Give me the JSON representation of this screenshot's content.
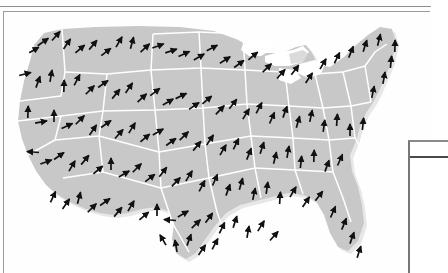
{
  "page": {
    "background_color": "#fefefe",
    "rule_color": "#8e8e8e",
    "frame_color": "#9b9b9b"
  },
  "figure": {
    "name": "us-vector-field-map",
    "caption": "",
    "map": {
      "region": "United States (contiguous)",
      "land_fill": "#c8c8c8",
      "state_border_color": "#ffffff",
      "ocean_fill": "#ffffff",
      "shadow_color": "#d9d9d9",
      "arrow_color": "#111111",
      "arrow_count": 268,
      "arrow_style": "line-with-solid-head"
    }
  },
  "side_panel": {
    "name": "legend-table",
    "visible_portion": "left edge only",
    "border_color": "#767676",
    "header_rule_color": "#4a4a4a",
    "header_label": "",
    "cell_label": ""
  },
  "chart_data": {
    "type": "scatter",
    "title": "",
    "subtitle": "",
    "xlabel": "",
    "ylabel": "",
    "grid": false,
    "legend_position": "right",
    "xlim": [
      0,
      400
    ],
    "ylim": [
      0,
      250
    ],
    "arrows": [
      {
        "x": 40,
        "y": 30,
        "angle": -35,
        "len": 13
      },
      {
        "x": 53,
        "y": 24,
        "angle": -48,
        "len": 12
      },
      {
        "x": 31,
        "y": 38,
        "angle": -30,
        "len": 11
      },
      {
        "x": 64,
        "y": 32,
        "angle": -55,
        "len": 12
      },
      {
        "x": 77,
        "y": 37,
        "angle": -40,
        "len": 12
      },
      {
        "x": 90,
        "y": 33,
        "angle": -50,
        "len": 12
      },
      {
        "x": 103,
        "y": 40,
        "angle": -38,
        "len": 12
      },
      {
        "x": 116,
        "y": 30,
        "angle": -60,
        "len": 12
      },
      {
        "x": 129,
        "y": 31,
        "angle": -75,
        "len": 12
      },
      {
        "x": 142,
        "y": 36,
        "angle": -42,
        "len": 12
      },
      {
        "x": 155,
        "y": 34,
        "angle": -20,
        "len": 12
      },
      {
        "x": 168,
        "y": 39,
        "angle": -18,
        "len": 12
      },
      {
        "x": 181,
        "y": 42,
        "angle": -25,
        "len": 12
      },
      {
        "x": 196,
        "y": 45,
        "angle": -30,
        "len": 12
      },
      {
        "x": 209,
        "y": 36,
        "angle": -28,
        "len": 12
      },
      {
        "x": 222,
        "y": 48,
        "angle": -32,
        "len": 12
      },
      {
        "x": 236,
        "y": 52,
        "angle": -36,
        "len": 12
      },
      {
        "x": 250,
        "y": 44,
        "angle": -40,
        "len": 12
      },
      {
        "x": 264,
        "y": 56,
        "angle": -44,
        "len": 12
      },
      {
        "x": 278,
        "y": 62,
        "angle": -48,
        "len": 12
      },
      {
        "x": 292,
        "y": 58,
        "angle": -52,
        "len": 12
      },
      {
        "x": 306,
        "y": 66,
        "angle": -56,
        "len": 12
      },
      {
        "x": 320,
        "y": 52,
        "angle": -60,
        "len": 12
      },
      {
        "x": 334,
        "y": 46,
        "angle": -64,
        "len": 12
      },
      {
        "x": 348,
        "y": 40,
        "angle": -68,
        "len": 12
      },
      {
        "x": 362,
        "y": 34,
        "angle": -72,
        "len": 12
      },
      {
        "x": 376,
        "y": 28,
        "angle": -76,
        "len": 12
      },
      {
        "x": 22,
        "y": 62,
        "angle": -15,
        "len": 12
      },
      {
        "x": 35,
        "y": 70,
        "angle": -70,
        "len": 12
      },
      {
        "x": 48,
        "y": 64,
        "angle": -80,
        "len": 12
      },
      {
        "x": 61,
        "y": 74,
        "angle": -88,
        "len": 12
      },
      {
        "x": 74,
        "y": 68,
        "angle": -62,
        "len": 12
      },
      {
        "x": 87,
        "y": 78,
        "angle": -45,
        "len": 12
      },
      {
        "x": 100,
        "y": 72,
        "angle": -35,
        "len": 12
      },
      {
        "x": 113,
        "y": 82,
        "angle": -50,
        "len": 12
      },
      {
        "x": 126,
        "y": 76,
        "angle": -55,
        "len": 12
      },
      {
        "x": 139,
        "y": 86,
        "angle": -42,
        "len": 12
      },
      {
        "x": 152,
        "y": 80,
        "angle": -38,
        "len": 12
      },
      {
        "x": 165,
        "y": 90,
        "angle": -30,
        "len": 12
      },
      {
        "x": 178,
        "y": 84,
        "angle": -26,
        "len": 12
      },
      {
        "x": 191,
        "y": 94,
        "angle": -34,
        "len": 12
      },
      {
        "x": 204,
        "y": 88,
        "angle": -40,
        "len": 12
      },
      {
        "x": 217,
        "y": 98,
        "angle": -46,
        "len": 12
      },
      {
        "x": 230,
        "y": 92,
        "angle": -52,
        "len": 12
      },
      {
        "x": 243,
        "y": 102,
        "angle": -58,
        "len": 12
      },
      {
        "x": 256,
        "y": 96,
        "angle": -62,
        "len": 12
      },
      {
        "x": 269,
        "y": 106,
        "angle": -66,
        "len": 12
      },
      {
        "x": 282,
        "y": 100,
        "angle": -70,
        "len": 12
      },
      {
        "x": 295,
        "y": 110,
        "angle": -74,
        "len": 12
      },
      {
        "x": 308,
        "y": 104,
        "angle": -78,
        "len": 12
      },
      {
        "x": 321,
        "y": 114,
        "angle": -82,
        "len": 12
      },
      {
        "x": 334,
        "y": 108,
        "angle": -86,
        "len": 12
      },
      {
        "x": 347,
        "y": 118,
        "angle": -90,
        "len": 12
      },
      {
        "x": 360,
        "y": 112,
        "angle": -84,
        "len": 12
      },
      {
        "x": 25,
        "y": 100,
        "angle": -88,
        "len": 12
      },
      {
        "x": 38,
        "y": 110,
        "angle": -10,
        "len": 12
      },
      {
        "x": 51,
        "y": 104,
        "angle": -90,
        "len": 12
      },
      {
        "x": 64,
        "y": 114,
        "angle": -25,
        "len": 12
      },
      {
        "x": 77,
        "y": 108,
        "angle": -45,
        "len": 12
      },
      {
        "x": 90,
        "y": 118,
        "angle": -55,
        "len": 12
      },
      {
        "x": 103,
        "y": 112,
        "angle": -35,
        "len": 12
      },
      {
        "x": 116,
        "y": 122,
        "angle": -48,
        "len": 12
      },
      {
        "x": 129,
        "y": 116,
        "angle": -58,
        "len": 12
      },
      {
        "x": 142,
        "y": 126,
        "angle": -40,
        "len": 12
      },
      {
        "x": 155,
        "y": 120,
        "angle": -30,
        "len": 12
      },
      {
        "x": 168,
        "y": 130,
        "angle": -36,
        "len": 12
      },
      {
        "x": 181,
        "y": 124,
        "angle": -44,
        "len": 12
      },
      {
        "x": 194,
        "y": 134,
        "angle": -50,
        "len": 12
      },
      {
        "x": 207,
        "y": 128,
        "angle": -56,
        "len": 12
      },
      {
        "x": 220,
        "y": 138,
        "angle": -60,
        "len": 12
      },
      {
        "x": 233,
        "y": 132,
        "angle": -64,
        "len": 12
      },
      {
        "x": 246,
        "y": 142,
        "angle": -68,
        "len": 12
      },
      {
        "x": 259,
        "y": 136,
        "angle": -72,
        "len": 12
      },
      {
        "x": 272,
        "y": 146,
        "angle": -76,
        "len": 12
      },
      {
        "x": 285,
        "y": 140,
        "angle": -80,
        "len": 12
      },
      {
        "x": 298,
        "y": 150,
        "angle": -84,
        "len": 12
      },
      {
        "x": 311,
        "y": 144,
        "angle": -88,
        "len": 12
      },
      {
        "x": 324,
        "y": 154,
        "angle": -70,
        "len": 12
      },
      {
        "x": 337,
        "y": 148,
        "angle": -66,
        "len": 12
      },
      {
        "x": 30,
        "y": 140,
        "angle": -175,
        "len": 12
      },
      {
        "x": 43,
        "y": 150,
        "angle": -20,
        "len": 12
      },
      {
        "x": 56,
        "y": 144,
        "angle": -35,
        "len": 12
      },
      {
        "x": 69,
        "y": 154,
        "angle": -60,
        "len": 12
      },
      {
        "x": 82,
        "y": 148,
        "angle": -50,
        "len": 12
      },
      {
        "x": 95,
        "y": 158,
        "angle": -40,
        "len": 12
      },
      {
        "x": 108,
        "y": 152,
        "angle": -90,
        "len": 12
      },
      {
        "x": 121,
        "y": 162,
        "angle": -30,
        "len": 12
      },
      {
        "x": 134,
        "y": 156,
        "angle": -45,
        "len": 12
      },
      {
        "x": 147,
        "y": 166,
        "angle": -38,
        "len": 12
      },
      {
        "x": 160,
        "y": 160,
        "angle": -52,
        "len": 12
      },
      {
        "x": 173,
        "y": 170,
        "angle": -46,
        "len": 12
      },
      {
        "x": 186,
        "y": 164,
        "angle": -58,
        "len": 12
      },
      {
        "x": 199,
        "y": 174,
        "angle": -62,
        "len": 12
      },
      {
        "x": 212,
        "y": 168,
        "angle": -66,
        "len": 12
      },
      {
        "x": 225,
        "y": 178,
        "angle": -70,
        "len": 12
      },
      {
        "x": 238,
        "y": 172,
        "angle": -74,
        "len": 12
      },
      {
        "x": 251,
        "y": 182,
        "angle": -78,
        "len": 12
      },
      {
        "x": 264,
        "y": 176,
        "angle": -82,
        "len": 12
      },
      {
        "x": 277,
        "y": 186,
        "angle": -86,
        "len": 12
      },
      {
        "x": 290,
        "y": 180,
        "angle": -60,
        "len": 12
      },
      {
        "x": 303,
        "y": 190,
        "angle": -56,
        "len": 12
      },
      {
        "x": 316,
        "y": 184,
        "angle": -52,
        "len": 12
      },
      {
        "x": 50,
        "y": 185,
        "angle": -65,
        "len": 12
      },
      {
        "x": 63,
        "y": 192,
        "angle": -55,
        "len": 12
      },
      {
        "x": 76,
        "y": 186,
        "angle": -75,
        "len": 12
      },
      {
        "x": 89,
        "y": 196,
        "angle": -45,
        "len": 12
      },
      {
        "x": 102,
        "y": 190,
        "angle": -35,
        "len": 12
      },
      {
        "x": 115,
        "y": 200,
        "angle": -50,
        "len": 12
      },
      {
        "x": 128,
        "y": 194,
        "angle": -60,
        "len": 12
      },
      {
        "x": 141,
        "y": 204,
        "angle": -40,
        "len": 12
      },
      {
        "x": 154,
        "y": 198,
        "angle": -90,
        "len": 12
      },
      {
        "x": 167,
        "y": 208,
        "angle": -175,
        "len": 12
      },
      {
        "x": 180,
        "y": 202,
        "angle": -30,
        "len": 12
      },
      {
        "x": 193,
        "y": 212,
        "angle": -44,
        "len": 12
      },
      {
        "x": 206,
        "y": 206,
        "angle": -54,
        "len": 12
      },
      {
        "x": 219,
        "y": 216,
        "angle": -64,
        "len": 12
      },
      {
        "x": 232,
        "y": 210,
        "angle": -72,
        "len": 12
      },
      {
        "x": 245,
        "y": 220,
        "angle": -80,
        "len": 12
      },
      {
        "x": 258,
        "y": 214,
        "angle": -58,
        "len": 12
      },
      {
        "x": 271,
        "y": 224,
        "angle": -48,
        "len": 12
      },
      {
        "x": 160,
        "y": 228,
        "angle": -120,
        "len": 12
      },
      {
        "x": 173,
        "y": 234,
        "angle": -100,
        "len": 12
      },
      {
        "x": 186,
        "y": 228,
        "angle": -70,
        "len": 12
      },
      {
        "x": 199,
        "y": 238,
        "angle": -55,
        "len": 12
      },
      {
        "x": 212,
        "y": 232,
        "angle": -62,
        "len": 12
      },
      {
        "x": 330,
        "y": 200,
        "angle": -66,
        "len": 12
      },
      {
        "x": 341,
        "y": 212,
        "angle": -68,
        "len": 12
      },
      {
        "x": 349,
        "y": 226,
        "angle": -70,
        "len": 12
      },
      {
        "x": 356,
        "y": 240,
        "angle": -72,
        "len": 12
      },
      {
        "x": 370,
        "y": 80,
        "angle": -78,
        "len": 12
      },
      {
        "x": 381,
        "y": 66,
        "angle": -80,
        "len": 12
      },
      {
        "x": 388,
        "y": 50,
        "angle": -84,
        "len": 12
      },
      {
        "x": 392,
        "y": 34,
        "angle": -88,
        "len": 12
      }
    ]
  }
}
